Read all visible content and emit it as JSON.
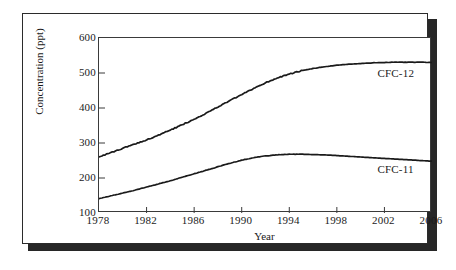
{
  "chart_data": {
    "type": "line",
    "title": "",
    "xlabel": "Year",
    "ylabel": "Concentration (ppt)",
    "xlim": [
      1978,
      2006
    ],
    "ylim": [
      100,
      600
    ],
    "xticks": [
      1978,
      1982,
      1986,
      1990,
      1994,
      1998,
      2002,
      2006
    ],
    "xticklabels": [
      "1978",
      "1982",
      "1986",
      "1990",
      "1994",
      "1998",
      "2002",
      "2006"
    ],
    "yticks": [
      100,
      200,
      300,
      400,
      500,
      600
    ],
    "yticklabels": [
      "100",
      "200",
      "300",
      "400",
      "500",
      "600"
    ],
    "grid": false,
    "legend_position": "inline-annotation",
    "series": [
      {
        "name": "CFC-12",
        "color": "#1a1a1a",
        "label_year": 2001.5,
        "label_value": 498,
        "x": [
          1978,
          1979,
          1980,
          1981,
          1982,
          1983,
          1984,
          1985,
          1986,
          1987,
          1988,
          1989,
          1990,
          1991,
          1992,
          1993,
          1994,
          1995,
          1996,
          1997,
          1998,
          1999,
          2000,
          2001,
          2002,
          2003,
          2004,
          2005,
          2006
        ],
        "values": [
          261,
          272,
          285,
          297,
          309,
          322,
          337,
          352,
          368,
          385,
          403,
          421,
          438,
          456,
          472,
          486,
          497,
          506,
          513,
          518,
          522,
          525,
          527,
          529,
          530,
          531,
          531,
          531,
          530
        ]
      },
      {
        "name": "CFC-11",
        "color": "#1a1a1a",
        "label_year": 2001.5,
        "label_value": 222,
        "x": [
          1978,
          1979,
          1980,
          1981,
          1982,
          1983,
          1984,
          1985,
          1986,
          1987,
          1988,
          1989,
          1990,
          1991,
          1992,
          1993,
          1994,
          1995,
          1996,
          1997,
          1998,
          1999,
          2000,
          2001,
          2002,
          2003,
          2004,
          2005,
          2006
        ],
        "values": [
          141,
          149,
          157,
          165,
          174,
          183,
          192,
          202,
          212,
          222,
          232,
          242,
          251,
          258,
          263,
          266,
          268,
          268,
          267,
          266,
          264,
          262,
          260,
          258,
          256,
          254,
          252,
          250,
          248
        ]
      }
    ]
  }
}
